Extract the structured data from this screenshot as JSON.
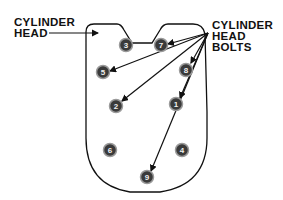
{
  "labels": {
    "cylinder_head_line1": "CYLINDER",
    "cylinder_head_line2": "HEAD",
    "bolts_line1": "CYLINDER",
    "bolts_line2": "HEAD",
    "bolts_line3": "BOLTS"
  },
  "bolts": [
    {
      "number": "3",
      "x": 126,
      "y": 45
    },
    {
      "number": "7",
      "x": 161,
      "y": 45
    },
    {
      "number": "5",
      "x": 103,
      "y": 72
    },
    {
      "number": "8",
      "x": 186,
      "y": 70
    },
    {
      "number": "2",
      "x": 116,
      "y": 106
    },
    {
      "number": "1",
      "x": 176,
      "y": 104
    },
    {
      "number": "6",
      "x": 110,
      "y": 150
    },
    {
      "number": "4",
      "x": 182,
      "y": 150
    },
    {
      "number": "9",
      "x": 147,
      "y": 177
    }
  ],
  "colors": {
    "line": "#111111",
    "bolt_fill": "#3a3a3a",
    "bolt_ring": "#9a9a9a"
  }
}
